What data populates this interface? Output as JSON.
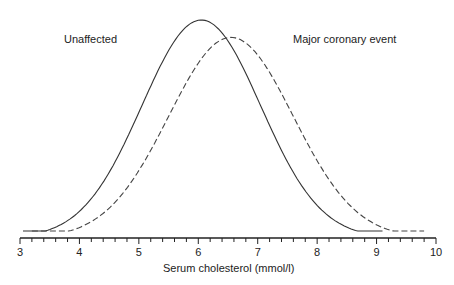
{
  "chart_data": {
    "type": "line",
    "title": "",
    "xlabel": "Serum cholesterol (mmol/l)",
    "ylabel": "",
    "xlim": [
      3,
      10
    ],
    "x_ticks": [
      3,
      4,
      5,
      6,
      7,
      8,
      9,
      10
    ],
    "minor_tick_step": 0.2,
    "grid": false,
    "legend": "inline annotations",
    "series": [
      {
        "name": "Unaffected",
        "style": "solid",
        "distribution": "normal",
        "mean": 6.05,
        "sd": 1.0,
        "relative_peak": 1.0,
        "x_range": [
          3.05,
          9.1
        ]
      },
      {
        "name": "Major coronary event",
        "style": "dashed",
        "distribution": "normal",
        "mean": 6.55,
        "sd": 1.05,
        "relative_peak": 0.92,
        "x_range": [
          3.2,
          9.8
        ]
      }
    ],
    "annotations": [
      {
        "text": "Unaffected",
        "near_x": 4.0
      },
      {
        "text": "Major coronary event",
        "near_x": 8.6
      }
    ]
  },
  "labels": {
    "unaffected": "Unaffected",
    "major": "Major coronary event",
    "xlabel": "Serum cholesterol (mmol/l)"
  }
}
